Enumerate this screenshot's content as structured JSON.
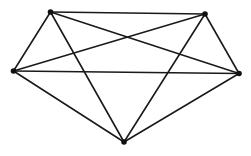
{
  "diagram": {
    "type": "graph",
    "name": "complete-graph-k5",
    "style": {
      "stroke": "#1a1a1a",
      "stroke_width": 1.6,
      "node_fill": "#111111",
      "node_radius": 2.8,
      "background": "#ffffff"
    },
    "nodes": [
      {
        "id": "A",
        "x": 50.5,
        "y": 12
      },
      {
        "id": "B",
        "x": 205,
        "y": 14
      },
      {
        "id": "C",
        "x": 13.5,
        "y": 71
      },
      {
        "id": "D",
        "x": 239,
        "y": 73.5
      },
      {
        "id": "E",
        "x": 124,
        "y": 142
      }
    ],
    "edges": [
      [
        "A",
        "B"
      ],
      [
        "A",
        "C"
      ],
      [
        "A",
        "D"
      ],
      [
        "A",
        "E"
      ],
      [
        "B",
        "C"
      ],
      [
        "B",
        "D"
      ],
      [
        "B",
        "E"
      ],
      [
        "C",
        "D"
      ],
      [
        "C",
        "E"
      ],
      [
        "D",
        "E"
      ]
    ]
  }
}
